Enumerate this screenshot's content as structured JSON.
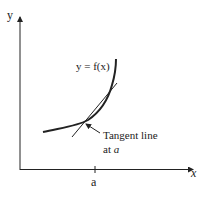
{
  "diagram": {
    "axes": {
      "y_label": "y",
      "x_label": "x",
      "x_tick_label": "a"
    },
    "curve_label": "y = f(x)",
    "tangent_label_line1": "Tangent line",
    "tangent_label_line2_prefix": "at ",
    "tangent_label_line2_var": "a",
    "colors": {
      "stroke": "#222222",
      "background": "#ffffff"
    }
  }
}
